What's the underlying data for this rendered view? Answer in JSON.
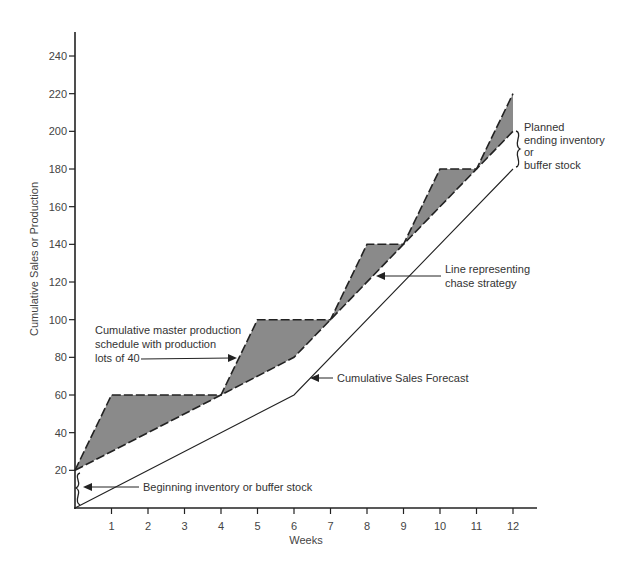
{
  "chart_data": {
    "type": "line",
    "title": "",
    "xlabel": "Weeks",
    "ylabel": "Cumulative Sales or Production",
    "xlim": [
      0,
      12
    ],
    "ylim": [
      0,
      250
    ],
    "x_ticks": [
      1,
      2,
      3,
      4,
      5,
      6,
      7,
      8,
      9,
      10,
      11,
      12
    ],
    "y_ticks": [
      20,
      40,
      60,
      80,
      100,
      120,
      140,
      160,
      180,
      200,
      220,
      240
    ],
    "grid": false,
    "legend": "none (inline annotations)",
    "series": [
      {
        "name": "Cumulative master production schedule with production lots of 40",
        "style": "dashed",
        "x": [
          0,
          1,
          4,
          5,
          7,
          8,
          9,
          10,
          11,
          12
        ],
        "values": [
          20,
          60,
          60,
          100,
          100,
          140,
          140,
          180,
          180,
          220
        ]
      },
      {
        "name": "Line representing chase strategy",
        "style": "dashed",
        "x": [
          0,
          4,
          6,
          12
        ],
        "values": [
          20,
          60,
          80,
          200
        ]
      },
      {
        "name": "Cumulative Sales Forecast",
        "style": "solid",
        "x": [
          0,
          6,
          12
        ],
        "values": [
          0,
          60,
          180
        ]
      }
    ],
    "shaded_region": "Area between master production schedule and chase strategy line (inventory above chase) shaded gray",
    "annotations": [
      {
        "text": [
          "Cumulative master production",
          "schedule with production",
          "lots of 40"
        ],
        "points_to": "master production schedule at week ~4.5"
      },
      {
        "text": [
          "Cumulative Sales Forecast"
        ],
        "points_to": "sales forecast line at week ~6.3"
      },
      {
        "text": [
          "Line representing",
          "chase strategy"
        ],
        "points_to": "chase line at week ~8.2"
      },
      {
        "text": [
          "Beginning inventory or buffer stock"
        ],
        "points_to": "brace from 0 to 20 at week 0"
      },
      {
        "text": [
          "Planned",
          "ending inventory",
          "or",
          "buffer stock"
        ],
        "points_to": "brace from 180 to 200 at week 12"
      }
    ]
  },
  "layout": {
    "x0": 75,
    "px_per_week": 36.5,
    "y0": 508,
    "px_per_unit": 1.8833,
    "axis_top": 32,
    "axis_right": 537,
    "fill_color": "#8a8a8a",
    "line_color": "#222222",
    "axis_color": "#222222"
  },
  "labels": {
    "ylabel": "Cumulative Sales or Production",
    "xlabel": "Weeks",
    "mps_lines": [
      "Cumulative master production",
      "schedule with production",
      "lots of 40"
    ],
    "forecast": "Cumulative Sales Forecast",
    "chase_lines": [
      "Line representing",
      "chase strategy"
    ],
    "beginning": "Beginning inventory or buffer stock",
    "ending_lines": [
      "Planned",
      "ending inventory",
      "or",
      "buffer stock"
    ],
    "caption": "FIGURE (caption illegible)"
  }
}
